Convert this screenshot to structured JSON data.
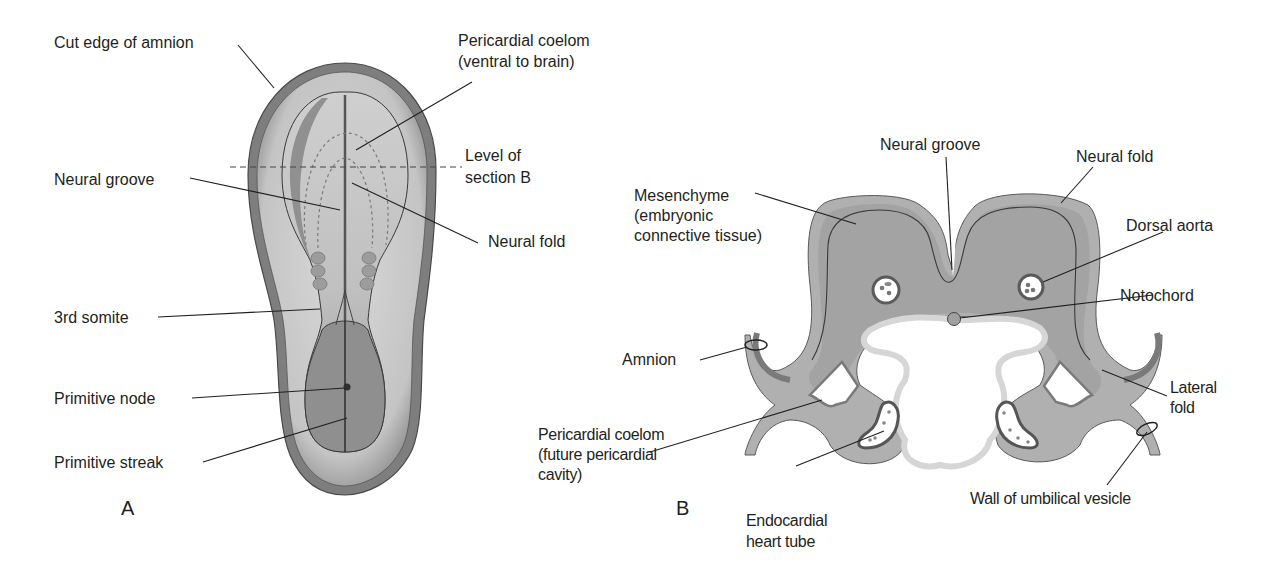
{
  "figure": {
    "panel_a": {
      "letter": "A",
      "labels": {
        "cut_edge_amnion": "Cut edge of amnion",
        "pericardial_coelom_1": "Pericardial coelom",
        "pericardial_coelom_2": "(ventral to brain)",
        "level_section_1": "Level of",
        "level_section_2": "section B",
        "neural_groove": "Neural groove",
        "neural_fold": "Neural fold",
        "third_somite": "3rd somite",
        "primitive_node": "Primitive node",
        "primitive_streak": "Primitive streak"
      }
    },
    "panel_b": {
      "letter": "B",
      "labels": {
        "neural_groove": "Neural groove",
        "neural_fold": "Neural fold",
        "mesenchyme_1": "Mesenchyme",
        "mesenchyme_2": "(embryonic",
        "mesenchyme_3": "connective tissue)",
        "dorsal_aorta": "Dorsal aorta",
        "notochord": "Notochord",
        "amnion": "Amnion",
        "lateral_fold_1": "Lateral",
        "lateral_fold_2": "fold",
        "pericardial_coelom_1": "Pericardial coelom",
        "pericardial_coelom_2": "(future pericardial",
        "pericardial_coelom_3": "cavity)",
        "endocardial_1": "Endocardial",
        "endocardial_2": "heart tube",
        "wall_umbilical_vesicle": "Wall of umbilical vesicle"
      }
    },
    "colors": {
      "text": "#231f20",
      "tissue_mid": "#a9a9a9",
      "tissue_light": "#d2d2d2",
      "tissue_dark": "#7a7a7a",
      "outline": "#3a3a3a"
    }
  }
}
